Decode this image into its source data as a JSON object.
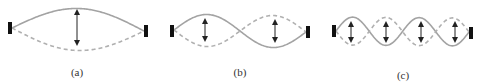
{
  "figure": {
    "colors": {
      "string_solid": "#a3a3a3",
      "string_dashed": "#b0b0b0",
      "end_block": "#111111",
      "arrow": "#222222",
      "label": "#333333"
    },
    "panels": [
      {
        "id": "a",
        "label": "(a)",
        "label_x": 77,
        "label_y": 66,
        "harmonic": 1,
        "left_block": {
          "x": 8,
          "y": 22,
          "w": 4,
          "h": 12
        },
        "right_block": {
          "x": 144,
          "y": 25,
          "w": 4,
          "h": 12
        },
        "start": [
          12,
          28
        ],
        "end": [
          144,
          31
        ],
        "amplitude": 21,
        "arrows": [
          {
            "x": 77,
            "y1": 12,
            "y2": 43
          }
        ]
      },
      {
        "id": "b",
        "label": "(b)",
        "label_x": 240,
        "label_y": 66,
        "harmonic": 2,
        "left_block": {
          "x": 170,
          "y": 25,
          "w": 4,
          "h": 12
        },
        "right_block": {
          "x": 306,
          "y": 26,
          "w": 4,
          "h": 12
        },
        "start": [
          174,
          30
        ],
        "end": [
          306,
          32
        ],
        "amplitude": 16,
        "arrows": [
          {
            "x": 205,
            "y1": 21,
            "y2": 39
          },
          {
            "x": 275,
            "y1": 22,
            "y2": 40
          }
        ]
      },
      {
        "id": "c",
        "label": "(c)",
        "label_x": 403,
        "label_y": 69,
        "harmonic": 4,
        "left_block": {
          "x": 332,
          "y": 25,
          "w": 4,
          "h": 12
        },
        "right_block": {
          "x": 469,
          "y": 27,
          "w": 4,
          "h": 12
        },
        "start": [
          336,
          31
        ],
        "end": [
          469,
          32
        ],
        "amplitude": 14,
        "arrows": [
          {
            "x": 351,
            "y1": 24,
            "y2": 40
          },
          {
            "x": 386,
            "y1": 24,
            "y2": 40
          },
          {
            "x": 421,
            "y1": 24,
            "y2": 40
          },
          {
            "x": 455,
            "y1": 24,
            "y2": 40
          }
        ]
      }
    ]
  }
}
